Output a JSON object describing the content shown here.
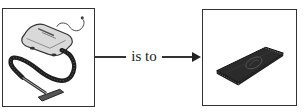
{
  "analogy": {
    "left_item": {
      "icon": "vacuum-cleaner-icon",
      "description": "canister vacuum cleaner with hose and floor nozzle"
    },
    "relation_label": "is to",
    "right_item": {
      "icon": "rug-icon",
      "description": "dark rectangular rug / mat"
    }
  },
  "colors": {
    "border": "#333333",
    "ink": "#222222",
    "background": "#ffffff"
  }
}
